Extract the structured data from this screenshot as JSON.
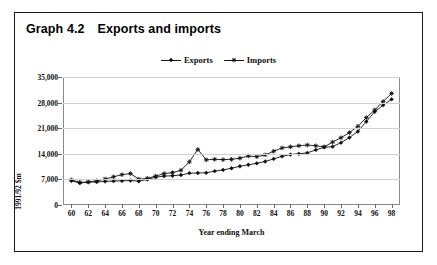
{
  "figure": {
    "title_number": "Graph 4.2",
    "title_text": "Exports and imports"
  },
  "chart_data": {
    "type": "line",
    "title": "Exports and imports",
    "xlabel": "Year ending March",
    "ylabel": "1991/92 $m",
    "xlim": [
      1959,
      1999
    ],
    "ylim": [
      0,
      35000
    ],
    "yticks": [
      0,
      7000,
      14000,
      21000,
      28000,
      35000
    ],
    "ytick_labels": [
      "0",
      "7,000",
      "14,000",
      "21,000",
      "28,000",
      "35,000"
    ],
    "xticks": [
      1960,
      1962,
      1964,
      1966,
      1968,
      1970,
      1972,
      1974,
      1976,
      1978,
      1980,
      1982,
      1984,
      1986,
      1988,
      1990,
      1992,
      1994,
      1996,
      1998
    ],
    "xtick_labels": [
      "60",
      "62",
      "64",
      "66",
      "68",
      "70",
      "72",
      "74",
      "76",
      "78",
      "80",
      "82",
      "84",
      "86",
      "88",
      "90",
      "92",
      "94",
      "96",
      "98"
    ],
    "grid": true,
    "legend_position": "top-center",
    "x": [
      1960,
      1961,
      1962,
      1963,
      1964,
      1965,
      1966,
      1967,
      1968,
      1969,
      1970,
      1971,
      1972,
      1973,
      1974,
      1975,
      1976,
      1977,
      1978,
      1979,
      1980,
      1981,
      1982,
      1983,
      1984,
      1985,
      1986,
      1987,
      1988,
      1989,
      1990,
      1991,
      1992,
      1993,
      1994,
      1995,
      1996,
      1997,
      1998
    ],
    "series": [
      {
        "name": "Exports",
        "marker": "diamond",
        "values": [
          6600,
          6000,
          6250,
          6300,
          6450,
          6550,
          6600,
          6700,
          6500,
          7000,
          7600,
          7900,
          8000,
          8200,
          8700,
          8750,
          8800,
          9250,
          9600,
          10050,
          10600,
          11000,
          11400,
          11900,
          12600,
          13300,
          13800,
          14000,
          14250,
          15050,
          15800,
          15950,
          17050,
          18450,
          20100,
          22800,
          25500,
          27300,
          28900
        ]
      },
      {
        "name": "Imports",
        "marker": "star",
        "values": [
          6850,
          6200,
          6300,
          6600,
          7100,
          7700,
          8300,
          8600,
          7050,
          7300,
          7900,
          8600,
          8850,
          9500,
          11800,
          15200,
          12350,
          12500,
          12400,
          12500,
          12800,
          13400,
          13200,
          13700,
          14700,
          15600,
          15900,
          16200,
          16400,
          16200,
          15900,
          17200,
          18400,
          19800,
          21500,
          23900,
          26000,
          28300,
          30500
        ]
      }
    ]
  }
}
